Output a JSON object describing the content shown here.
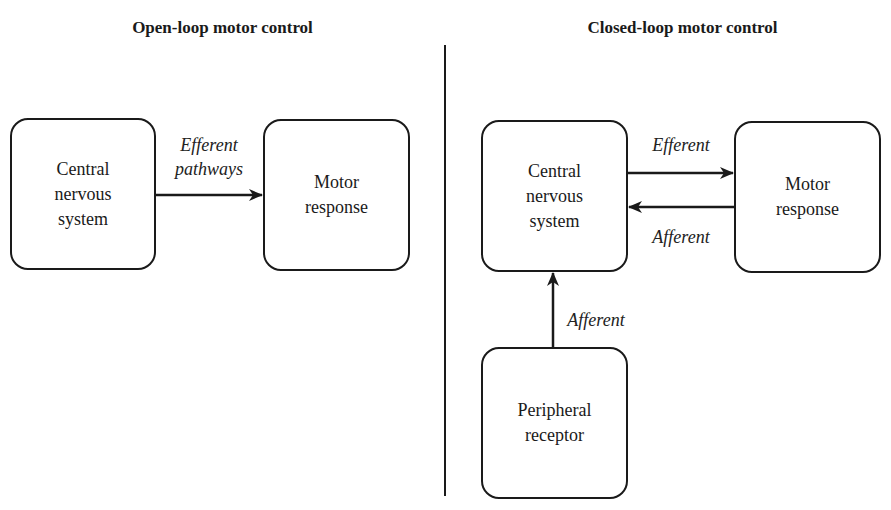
{
  "open_loop": {
    "title": "Open-loop motor control",
    "cns_box": "Central\nnervous\nsystem",
    "motor_box": "Motor\nresponse",
    "arrow_label": "Efferent\npathways"
  },
  "closed_loop": {
    "title": "Closed-loop motor control",
    "cns_box": "Central\nnervous\nsystem",
    "motor_box": "Motor\nresponse",
    "peripheral_box": "Peripheral\nreceptor",
    "efferent_label": "Efferent",
    "afferent_label_motor": "Afferent",
    "afferent_label_peripheral": "Afferent"
  },
  "colors": {
    "stroke": "#1a1a1a",
    "background": "#ffffff"
  }
}
